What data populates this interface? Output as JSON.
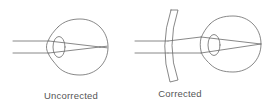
{
  "diagram": {
    "panels": [
      {
        "id": "uncorrected",
        "caption": "Uncorrected"
      },
      {
        "id": "corrected",
        "caption": "Corrected"
      }
    ],
    "colors": {
      "stroke": "#666666",
      "text": "#555555",
      "background": "#ffffff"
    }
  }
}
